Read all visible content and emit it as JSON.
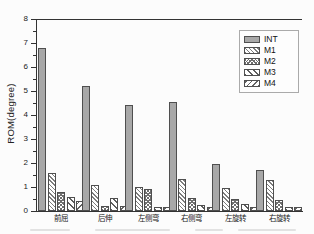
{
  "chart_data": {
    "type": "bar",
    "title": "",
    "xlabel": "",
    "ylabel": "ROM(degree)",
    "ylim": [
      0,
      8
    ],
    "yticks": [
      0,
      1,
      2,
      3,
      4,
      5,
      6,
      7,
      8
    ],
    "minor_tick_step": 0.5,
    "grid": false,
    "legend_position": "top-right",
    "categories": [
      "前屈",
      "后伸",
      "左侧弯",
      "右侧弯",
      "左旋转",
      "右旋转"
    ],
    "series": [
      {
        "name": "INT",
        "pattern": "solid-gray",
        "values": [
          6.8,
          5.2,
          4.4,
          4.55,
          1.95,
          1.7
        ]
      },
      {
        "name": "M1",
        "pattern": "diagonal-fine",
        "values": [
          1.6,
          1.1,
          1.0,
          1.35,
          0.97,
          1.3
        ]
      },
      {
        "name": "M2",
        "pattern": "crosshatch-dense",
        "values": [
          0.8,
          0.2,
          0.9,
          0.55,
          0.52,
          0.45
        ]
      },
      {
        "name": "M3",
        "pattern": "diagonal-wide",
        "values": [
          0.6,
          0.55,
          0.18,
          0.27,
          0.28,
          0.17
        ]
      },
      {
        "name": "M4",
        "pattern": "backslash",
        "values": [
          0.4,
          0.2,
          0.18,
          0.16,
          0.15,
          0.17
        ]
      }
    ]
  },
  "colors": {
    "axis": "#333333",
    "bar_edge": "#4f4f4f",
    "int_fill": "#a8a8a8",
    "background": "#fcfcfc",
    "legend_border": "#aaaaaa"
  }
}
